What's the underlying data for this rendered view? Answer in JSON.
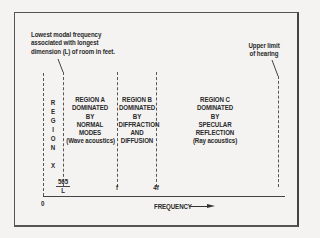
{
  "diagram": {
    "annotations": {
      "lowest_modal": [
        "Lowest modal frequency",
        "associated with longest",
        "dimension (L) of room in feet."
      ],
      "upper_limit": [
        "Upper limit",
        "of hearing"
      ]
    },
    "regions": {
      "x": {
        "letters": [
          "R",
          "E",
          "G",
          "I",
          "O",
          "N",
          "",
          "X"
        ]
      },
      "a": {
        "lines": [
          "REGION A",
          "DOMINATED",
          "BY",
          "NORMAL",
          "MODES",
          "(Wave acoustics)"
        ]
      },
      "b": {
        "lines": [
          "REGION B",
          "DOMINATED",
          "BY",
          "DIFFRACTION",
          "AND",
          "DIFFUSION"
        ]
      },
      "c": {
        "lines": [
          "REGION C",
          "DOMINATED",
          "BY",
          "SPECULAR",
          "REFLECTION",
          "(Ray acoustics)"
        ]
      }
    },
    "axis": {
      "origin": "0",
      "label": "FREQUENCY",
      "ticks": {
        "numerator": "565",
        "denominator": "L",
        "f": "f",
        "four_f": "4f"
      }
    },
    "colors": {
      "line": "#444444",
      "background": "#f4f3f1",
      "text": "#2a2a2a"
    }
  }
}
